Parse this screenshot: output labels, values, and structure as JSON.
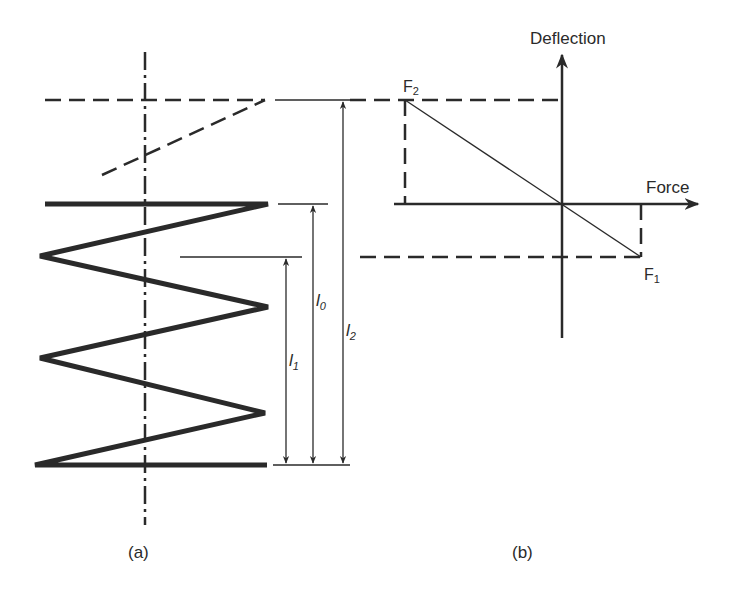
{
  "panel_a": {
    "caption": "(a)",
    "dimensions": [
      {
        "symbol": "l",
        "subscript": "1"
      },
      {
        "symbol": "l",
        "subscript": "0"
      },
      {
        "symbol": "l",
        "subscript": "2"
      }
    ]
  },
  "panel_b": {
    "caption": "(b)",
    "y_axis_label": "Deflection",
    "x_axis_label": "Force",
    "points": [
      {
        "symbol": "F",
        "subscript": "2"
      },
      {
        "symbol": "F",
        "subscript": "1"
      }
    ]
  },
  "colors": {
    "ink": "#2a2a2a",
    "background": "#ffffff"
  }
}
